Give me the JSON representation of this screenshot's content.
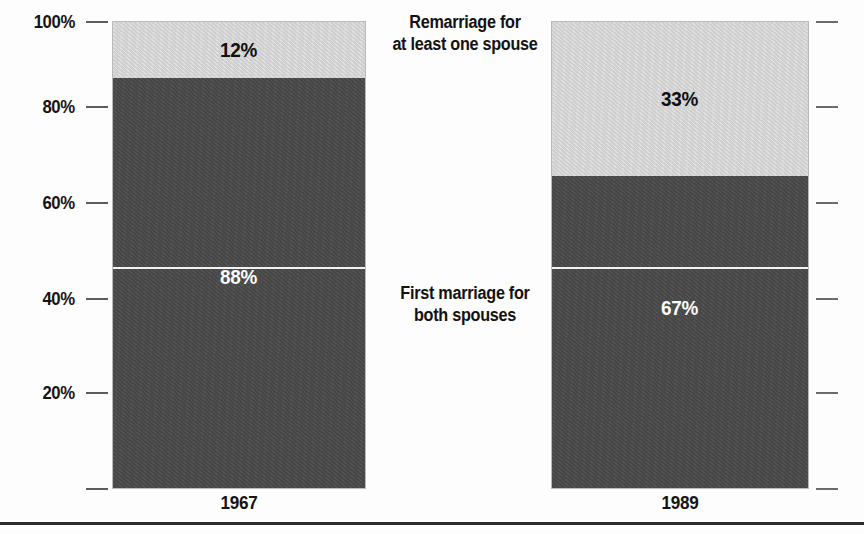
{
  "chart_data": {
    "type": "bar",
    "title": "",
    "subtitle": "",
    "xlabel": "",
    "ylabel": "",
    "ylim": [
      0,
      100
    ],
    "grid": false,
    "stacked": true,
    "legend_position": "center-inline",
    "categories": [
      "1967",
      "1989"
    ],
    "series": [
      {
        "name": "First marriage for both spouses",
        "color": "#4b4b4b",
        "values": [
          88,
          67
        ],
        "value_labels": [
          "88%",
          "67%"
        ]
      },
      {
        "name": "Remarriage for at least one spouse",
        "color": "#cfcfcf",
        "values": [
          12,
          33
        ],
        "value_labels": [
          "12%",
          "33%"
        ]
      }
    ],
    "yticks": [
      100,
      80,
      60,
      40,
      20
    ],
    "ytick_labels": [
      "100%",
      "80%",
      "60%",
      "40%",
      "20%"
    ],
    "annotations": [
      {
        "id": "remarriage",
        "lines": [
          "Remarriage for",
          "at least one spouse"
        ]
      },
      {
        "id": "first-marriage",
        "lines": [
          "First marriage for",
          "both spouses"
        ]
      }
    ]
  },
  "axis": {
    "y_ticks": [
      {
        "label": "100%",
        "top": 11
      },
      {
        "label": "80%",
        "top": 96
      },
      {
        "label": "60%",
        "top": 192
      },
      {
        "label": "40%",
        "top": 288
      },
      {
        "label": "20%",
        "top": 382
      }
    ],
    "y_ticks_unlabeled": [
      {
        "top": 478
      }
    ],
    "y_ticks_right": [
      {
        "top": 11
      },
      {
        "top": 96
      },
      {
        "top": 192
      },
      {
        "top": 288
      },
      {
        "top": 382
      },
      {
        "top": 478
      }
    ]
  },
  "bars": [
    {
      "category": "1967",
      "left": 113,
      "width": 252,
      "top": 22,
      "height": 466,
      "label_top": 492,
      "segments": [
        {
          "kind": "light",
          "label": "12%",
          "percent": 12,
          "flex": 12,
          "label_offset": 0
        },
        {
          "kind": "dark",
          "label": "88%",
          "percent": 88,
          "flex": 88,
          "label_offset": -12
        }
      ]
    },
    {
      "category": "1989",
      "left": 552,
      "width": 256,
      "top": 22,
      "height": 466,
      "label_top": 492,
      "segments": [
        {
          "kind": "light",
          "label": "33%",
          "percent": 33,
          "flex": 33,
          "label_offset": 0
        },
        {
          "kind": "dark",
          "label": "67%",
          "percent": 67,
          "flex": 67,
          "label_offset": -47
        }
      ]
    }
  ],
  "white_rule": {
    "top": 267,
    "segments": [
      {
        "left": 113,
        "width": 252
      },
      {
        "left": 552,
        "width": 256
      }
    ]
  },
  "annotation_blocks": [
    {
      "id": "remarriage",
      "left": 377,
      "top": 12,
      "width": 176
    },
    {
      "id": "first-marriage",
      "left": 377,
      "top": 283,
      "width": 176
    }
  ],
  "colors": {
    "light_segment": "#cfcfcf",
    "dark_segment": "#4b4b4b",
    "background": "#fdfdfd",
    "text": "#141414",
    "tick": "#5d5d5d",
    "rule": "#2c2c2c",
    "white_line": "#f2f2f2"
  }
}
